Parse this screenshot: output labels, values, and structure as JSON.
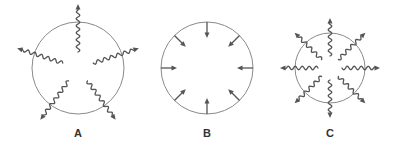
{
  "figure": {
    "panels": [
      {
        "id": "A",
        "label": "A",
        "arrow_style": "wavy",
        "direction": "outward",
        "arrow_count": 5,
        "arrows_cross_boundary": true
      },
      {
        "id": "B",
        "label": "B",
        "arrow_style": "straight",
        "direction": "inward",
        "arrow_count": 8,
        "arrows_cross_boundary": false
      },
      {
        "id": "C",
        "label": "C",
        "arrow_style": "wavy",
        "direction": "outward",
        "arrow_count": 8,
        "arrows_cross_boundary": true
      }
    ],
    "colors": {
      "circle": "#8a8a8a",
      "arrow": "#555555",
      "label": "#333333",
      "background": "#ffffff"
    }
  }
}
